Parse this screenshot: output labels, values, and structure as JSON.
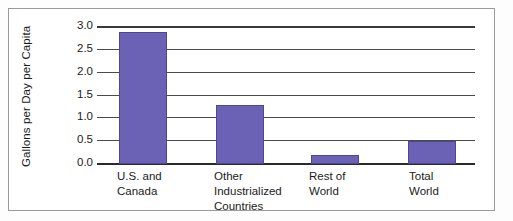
{
  "chart_data": {
    "type": "bar",
    "title": "",
    "xlabel": "",
    "ylabel": "Gallons per Day per Capita",
    "categories": [
      "U.S. and\nCanada",
      "Other\nIndustrialized\nCountries",
      "Rest of\nWorld",
      "Total\nWorld"
    ],
    "values": [
      2.9,
      1.3,
      0.2,
      0.5
    ],
    "ylim": [
      0.0,
      3.0
    ],
    "yticks": [
      "0.0",
      "0.5",
      "1.0",
      "1.5",
      "2.0",
      "2.5",
      "3.0"
    ],
    "ytick_values": [
      0.0,
      0.5,
      1.0,
      1.5,
      2.0,
      2.5,
      3.0
    ],
    "grid": true,
    "legend": null,
    "bar_color": "#6b62b5",
    "grid_color": "#4a4a4a",
    "axis_color": "#2b2b2b",
    "frame_color": "#9a9a9a"
  }
}
